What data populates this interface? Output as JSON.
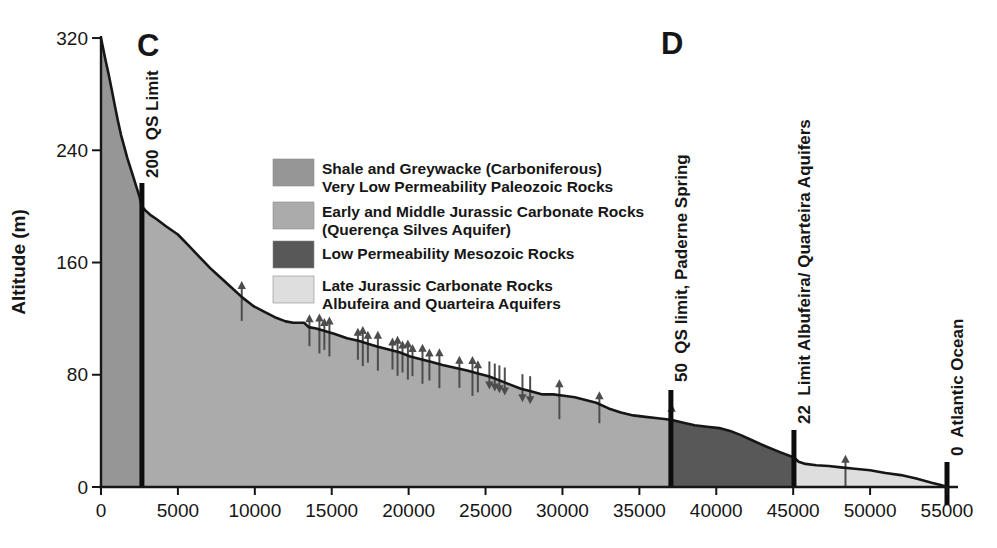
{
  "figure": {
    "ylabel": "Altitude (m)",
    "section_c": "C",
    "section_d": "D"
  },
  "legend": {
    "entries": [
      {
        "swatch": "shale-greywacke-swatch",
        "color": "#969696",
        "lines": [
          "Shale and Greywacke (Carboniferous)",
          "Very Low Permeability Paleozoic Rocks"
        ]
      },
      {
        "swatch": "qs-aquifer-swatch",
        "color": "#ababab",
        "lines": [
          "Early and Middle Jurassic Carbonate Rocks",
          "(Querença Silves Aquifer)"
        ]
      },
      {
        "swatch": "mesozoic-swatch",
        "color": "#585858",
        "lines": [
          "Low Permeability Mesozoic Rocks"
        ]
      },
      {
        "swatch": "late-jurassic-swatch",
        "color": "#dedede",
        "lines": [
          "Late Jurassic Carbonate Rocks",
          "Albufeira and Quarteira Aquifers"
        ]
      }
    ]
  },
  "chart_data": {
    "type": "area",
    "title": "",
    "xlabel": "",
    "ylabel": "Altitude (m)",
    "xlim": [
      0,
      55000
    ],
    "ylim": [
      0,
      320
    ],
    "x_ticks": [
      0,
      5000,
      10000,
      15000,
      20000,
      25000,
      30000,
      35000,
      40000,
      45000,
      50000,
      55000
    ],
    "y_ticks": [
      0,
      80,
      160,
      240,
      320
    ],
    "profile": [
      [
        0,
        320
      ],
      [
        150,
        312
      ],
      [
        300,
        304
      ],
      [
        500,
        294
      ],
      [
        700,
        283
      ],
      [
        900,
        272
      ],
      [
        1100,
        261
      ],
      [
        1300,
        251
      ],
      [
        1500,
        243
      ],
      [
        1700,
        235
      ],
      [
        1900,
        228
      ],
      [
        2100,
        221
      ],
      [
        2300,
        214
      ],
      [
        2500,
        207
      ],
      [
        2660,
        200
      ],
      [
        2900,
        197
      ],
      [
        3200,
        194
      ],
      [
        3600,
        191
      ],
      [
        4200,
        186
      ],
      [
        5000,
        180
      ],
      [
        5700,
        172
      ],
      [
        6400,
        164
      ],
      [
        7100,
        156
      ],
      [
        7800,
        149
      ],
      [
        8500,
        142
      ],
      [
        9200,
        135
      ],
      [
        9900,
        129
      ],
      [
        10600,
        125
      ],
      [
        11300,
        121
      ],
      [
        12000,
        118
      ],
      [
        12500,
        117
      ],
      [
        13200,
        117
      ],
      [
        13500,
        114
      ],
      [
        14000,
        113
      ],
      [
        14600,
        111
      ],
      [
        15200,
        109
      ],
      [
        16000,
        106
      ],
      [
        16800,
        104
      ],
      [
        17400,
        102
      ],
      [
        18000,
        100
      ],
      [
        18700,
        98
      ],
      [
        19400,
        96
      ],
      [
        20100,
        93
      ],
      [
        20800,
        91
      ],
      [
        21500,
        89
      ],
      [
        22200,
        87
      ],
      [
        23000,
        85
      ],
      [
        23800,
        83
      ],
      [
        24500,
        81
      ],
      [
        25200,
        79
      ],
      [
        25900,
        76
      ],
      [
        26600,
        73
      ],
      [
        27300,
        70
      ],
      [
        28000,
        68
      ],
      [
        28700,
        66
      ],
      [
        29400,
        66
      ],
      [
        30100,
        65
      ],
      [
        30800,
        64
      ],
      [
        31500,
        62
      ],
      [
        32200,
        60
      ],
      [
        33000,
        56
      ],
      [
        33800,
        53
      ],
      [
        34600,
        51
      ],
      [
        35400,
        50
      ],
      [
        36200,
        49
      ],
      [
        37050,
        48
      ],
      [
        37800,
        46
      ],
      [
        38600,
        44
      ],
      [
        39400,
        43
      ],
      [
        40200,
        42
      ],
      [
        40900,
        40
      ],
      [
        41600,
        37
      ],
      [
        42400,
        33
      ],
      [
        43200,
        29
      ],
      [
        44100,
        25
      ],
      [
        45050,
        21
      ],
      [
        45350,
        18
      ],
      [
        45800,
        16.5
      ],
      [
        46500,
        15.5
      ],
      [
        47300,
        15
      ],
      [
        48100,
        14
      ],
      [
        49000,
        13
      ],
      [
        50000,
        12
      ],
      [
        51000,
        10
      ],
      [
        52000,
        8.5
      ],
      [
        53000,
        6
      ],
      [
        54000,
        3
      ],
      [
        54600,
        1.5
      ],
      [
        55000,
        0
      ]
    ],
    "regions": [
      {
        "name": "shale-greywacke-region",
        "from": 0,
        "to": 2660,
        "color": "#969696",
        "label": "Shale and Greywacke (Carboniferous) Very Low Permeability Paleozoic Rocks"
      },
      {
        "name": "querenca-silves-region",
        "from": 2660,
        "to": 37050,
        "color": "#ababab",
        "label": "Early and Middle Jurassic Carbonate Rocks (Querença Silves Aquifer)"
      },
      {
        "name": "mesozoic-region",
        "from": 37050,
        "to": 45050,
        "color": "#585858",
        "label": "Low Permeability Mesozoic Rocks"
      },
      {
        "name": "late-jurassic-region",
        "from": 45050,
        "to": 55000,
        "color": "#dedede",
        "label": "Late Jurassic Carbonate Rocks Albufeira and Quarteira Aquifers"
      }
    ],
    "markers": [
      {
        "name": "qs-limit-marker",
        "elevation": 200,
        "label": "200  QS Limit",
        "d": 2660,
        "bar_top_y": 183,
        "bar_bottom_y": 487,
        "label_y": 178
      },
      {
        "name": "paderne-spring-marker",
        "elevation": 50,
        "label": "50  QS limit, Paderne Spring",
        "d": 37050,
        "bar_top_y": 390,
        "bar_bottom_y": 487,
        "label_y": 382
      },
      {
        "name": "albufeira-quarteira-limit-marker",
        "elevation": 22,
        "label": "22  Limit Albufeira/ Quarteira Aquifers",
        "d": 45050,
        "bar_top_y": 430,
        "bar_bottom_y": 487,
        "label_y": 424
      },
      {
        "name": "atlantic-ocean-marker",
        "elevation": 0,
        "label": "0  Atlantic Ocean",
        "d": 55000,
        "bar_top_y": 462,
        "bar_bottom_y": 505,
        "label_y": 456
      }
    ],
    "flow_arrows": [
      {
        "d": 9150,
        "dir": "up"
      },
      {
        "d": 13550,
        "dir": "up"
      },
      {
        "d": 14200,
        "dir": "up"
      },
      {
        "d": 14520,
        "dir": "up"
      },
      {
        "d": 14850,
        "dir": "up"
      },
      {
        "d": 16700,
        "dir": "up"
      },
      {
        "d": 17020,
        "dir": "up"
      },
      {
        "d": 17350,
        "dir": "up"
      },
      {
        "d": 18000,
        "dir": "up"
      },
      {
        "d": 18950,
        "dir": "up"
      },
      {
        "d": 19280,
        "dir": "up"
      },
      {
        "d": 19600,
        "dir": "up"
      },
      {
        "d": 19950,
        "dir": "up"
      },
      {
        "d": 20250,
        "dir": "up"
      },
      {
        "d": 20900,
        "dir": "up"
      },
      {
        "d": 21350,
        "dir": "up"
      },
      {
        "d": 22000,
        "dir": "up"
      },
      {
        "d": 23300,
        "dir": "up"
      },
      {
        "d": 24150,
        "dir": "up"
      },
      {
        "d": 24500,
        "dir": "up"
      },
      {
        "d": 25250,
        "dir": "down"
      },
      {
        "d": 25600,
        "dir": "down"
      },
      {
        "d": 25900,
        "dir": "down"
      },
      {
        "d": 26250,
        "dir": "down"
      },
      {
        "d": 27400,
        "dir": "down"
      },
      {
        "d": 27900,
        "dir": "down"
      },
      {
        "d": 29800,
        "dir": "up"
      },
      {
        "d": 32400,
        "dir": "up"
      },
      {
        "d": 37100,
        "dir": "up"
      },
      {
        "d": 48400,
        "dir": "up"
      }
    ],
    "style": {
      "line_color": "#161616",
      "bar_color": "#0d0d0d",
      "arrow_color": "#4d4d4d",
      "axis_color": "#161616"
    }
  }
}
